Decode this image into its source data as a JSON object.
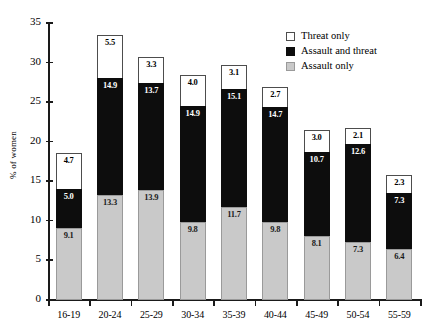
{
  "chart_data": {
    "type": "bar",
    "subtype": "stacked-bar",
    "title": "",
    "xlabel": "",
    "ylabel": "% of women",
    "ylim": [
      0,
      35
    ],
    "yticks": [
      0,
      5,
      10,
      15,
      20,
      25,
      30,
      35
    ],
    "grid": false,
    "legend_position": "top-right",
    "categories": [
      "16-19",
      "20-24",
      "25-29",
      "30-34",
      "35-39",
      "40-44",
      "45-49",
      "50-54",
      "55-59"
    ],
    "series": [
      {
        "name": "Assault only",
        "color": "#c9c9c9",
        "values": [
          9.1,
          13.3,
          13.9,
          9.8,
          11.7,
          9.8,
          8.1,
          7.3,
          6.4
        ]
      },
      {
        "name": "Assault and threat",
        "color": "#0d0d0d",
        "values": [
          5.0,
          14.9,
          13.7,
          14.9,
          15.1,
          14.7,
          10.7,
          12.6,
          7.3
        ]
      },
      {
        "name": "Threat only",
        "color": "#ffffff",
        "values": [
          4.7,
          5.5,
          3.3,
          4.0,
          3.1,
          2.7,
          3.0,
          2.1,
          2.3
        ]
      }
    ],
    "totals": [
      18.8,
      33.7,
      30.9,
      28.7,
      29.9,
      27.2,
      21.8,
      22.0,
      16.0
    ]
  },
  "legend": {
    "items": [
      {
        "label": "Threat only",
        "swatch": "white-square-icon"
      },
      {
        "label": "Assault and threat",
        "swatch": "black-square-icon"
      },
      {
        "label": "Assault only",
        "swatch": "gray-square-icon"
      }
    ]
  }
}
